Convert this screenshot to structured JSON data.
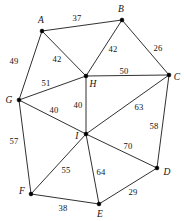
{
  "figure": {
    "kind": "weighted-undirected-graph",
    "width": 184,
    "height": 221,
    "background": "#ffffff",
    "stroke_color": "#1a1a1a",
    "text_color": "#111111"
  },
  "chart_data": {
    "type": "diagram",
    "title": "",
    "xlabel": "",
    "ylabel": "",
    "grid": false,
    "legend": "none",
    "nodes": [
      {
        "id": "A",
        "label": "A",
        "x": 42,
        "y": 31,
        "label_x": 41,
        "label_y": 21
      },
      {
        "id": "B",
        "label": "B",
        "x": 122,
        "y": 20,
        "label_x": 121,
        "label_y": 10
      },
      {
        "id": "C",
        "label": "C",
        "x": 169,
        "y": 75,
        "label_x": 177,
        "label_y": 78
      },
      {
        "id": "D",
        "label": "D",
        "x": 157,
        "y": 168,
        "label_x": 167,
        "label_y": 173
      },
      {
        "id": "E",
        "label": "E",
        "x": 99,
        "y": 204,
        "label_x": 100,
        "label_y": 215
      },
      {
        "id": "F",
        "label": "F",
        "x": 31,
        "y": 194,
        "label_x": 22,
        "label_y": 192
      },
      {
        "id": "G",
        "label": "G",
        "x": 19,
        "y": 100,
        "label_x": 9,
        "label_y": 101
      },
      {
        "id": "H",
        "label": "H",
        "x": 86,
        "y": 76,
        "label_x": 93,
        "label_y": 85
      },
      {
        "id": "I",
        "label": "I",
        "x": 86,
        "y": 134,
        "label_x": 77,
        "label_y": 137
      }
    ],
    "edges": [
      {
        "source": "A",
        "target": "B",
        "weight": 37,
        "label_x": 77,
        "label_y": 18
      },
      {
        "source": "A",
        "target": "G",
        "weight": 49,
        "label_x": 14,
        "label_y": 61
      },
      {
        "source": "A",
        "target": "H",
        "weight": 42,
        "label_x": 57,
        "label_y": 59
      },
      {
        "source": "B",
        "target": "H",
        "weight": 42,
        "label_x": 113,
        "label_y": 49
      },
      {
        "source": "B",
        "target": "C",
        "weight": 26,
        "label_x": 158,
        "label_y": 48
      },
      {
        "source": "H",
        "target": "C",
        "weight": 50,
        "label_x": 124,
        "label_y": 71
      },
      {
        "source": "C",
        "target": "D",
        "weight": 58,
        "label_x": 154,
        "label_y": 126
      },
      {
        "source": "G",
        "target": "H",
        "weight": 51,
        "label_x": 46,
        "label_y": 83
      },
      {
        "source": "H",
        "target": "I",
        "weight": 40,
        "label_x": 78,
        "label_y": 105
      },
      {
        "source": "G",
        "target": "I",
        "weight": 40,
        "label_x": 54,
        "label_y": 110
      },
      {
        "source": "G",
        "target": "F",
        "weight": 57,
        "label_x": 14,
        "label_y": 141
      },
      {
        "source": "I",
        "target": "C",
        "weight": 63,
        "label_x": 139,
        "label_y": 107
      },
      {
        "source": "I",
        "target": "D",
        "weight": 70,
        "label_x": 128,
        "label_y": 146
      },
      {
        "source": "I",
        "target": "F",
        "weight": 55,
        "label_x": 66,
        "label_y": 170
      },
      {
        "source": "I",
        "target": "E",
        "weight": 64,
        "label_x": 101,
        "label_y": 172
      },
      {
        "source": "F",
        "target": "E",
        "weight": 38,
        "label_x": 63,
        "label_y": 208
      },
      {
        "source": "E",
        "target": "D",
        "weight": 29,
        "label_x": 133,
        "label_y": 192
      }
    ]
  }
}
